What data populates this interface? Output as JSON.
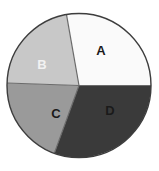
{
  "figure": {
    "type": "pie-chart-figure",
    "background_color": "#ffffff",
    "outline_color": "#3d3d3d",
    "divider_color": "#6b6b6b",
    "center_x": 79,
    "center_y": 85.5,
    "radius": 72
  },
  "chart_data": {
    "type": "pie",
    "title": "",
    "subtitle": "",
    "xlabel": "",
    "ylabel": "",
    "grid": false,
    "legend_position": "none",
    "labels_inside_slices": true,
    "start_angle_deg": -10,
    "direction": "clockwise",
    "categories": [
      "A",
      "B",
      "C",
      "D"
    ],
    "values": [
      27.8,
      30.6,
      20.0,
      21.7
    ],
    "percentages": [
      "27.8%",
      "30.6%",
      "20.0%",
      "21.7%"
    ],
    "angles_deg": [
      100,
      110,
      72,
      78
    ],
    "colors": [
      "#fafafa",
      "#3a3a3a",
      "#9a9a9a",
      "#c8c8c8"
    ],
    "label_colors": [
      "#1a1a1a",
      "#f2f2f2",
      "#1a1a1a",
      "#1a1a1a"
    ],
    "slices": [
      {
        "label": "A",
        "value": 27.8,
        "color": "#fafafa",
        "label_color": "#1a1a1a",
        "start_deg": -10,
        "end_deg": 90,
        "label_x": 101,
        "label_y": 52
      },
      {
        "label": "B",
        "value": 30.6,
        "color": "#3a3a3a",
        "label_color": "#f2f2f2",
        "start_deg": -120,
        "end_deg": -10,
        "label_x": 42,
        "label_y": 66
      },
      {
        "label": "C",
        "value": 20.0,
        "color": "#9a9a9a",
        "label_color": "#1a1a1a",
        "start_deg": -192,
        "end_deg": -120,
        "label_x": 56,
        "label_y": 115
      },
      {
        "label": "D",
        "value": 21.7,
        "color": "#c8c8c8",
        "label_color": "#1a1a1a",
        "start_deg": -270,
        "end_deg": -192,
        "label_x": 110,
        "label_y": 112
      }
    ]
  }
}
